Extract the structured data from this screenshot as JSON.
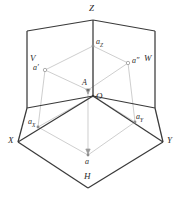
{
  "figure": {
    "type": "descriptive-geometry-three-projection-planes",
    "background_color": "#ffffff",
    "heavy_line_color": "#3a3a3a",
    "thin_line_color": "#b0b0b0",
    "text_color": "#2b2b2b"
  },
  "axes": {
    "z_label": "Z",
    "x_label": "X",
    "y_label": "Y",
    "origin_label": "O"
  },
  "planes": {
    "v_label": "V",
    "w_label": "W",
    "h_label": "H"
  },
  "points": {
    "space_point": "A",
    "front_projection": "a′",
    "profile_projection": "a″",
    "top_projection": "a",
    "x_intercept_base": "a",
    "x_intercept_sub": "X",
    "y_intercept_base": "a",
    "y_intercept_sub": "Y",
    "z_intercept_base": "a",
    "z_intercept_sub": "Z"
  },
  "geometry": {
    "origin": [
      93,
      96
    ],
    "z_apex": [
      93,
      20
    ],
    "x_corner": [
      18,
      142
    ],
    "y_corner": [
      163,
      142
    ],
    "v_top_left": [
      27,
      31
    ],
    "v_bottom_left": [
      27,
      108
    ],
    "w_top_right": [
      155,
      31
    ],
    "w_bottom_right": [
      155,
      108
    ],
    "h_front": [
      88,
      188
    ],
    "point_A": [
      88,
      90
    ],
    "a_front": [
      45,
      70
    ],
    "a_profile": [
      128,
      63
    ],
    "a_top": [
      88,
      155
    ],
    "a_x": [
      38,
      127
    ],
    "a_y": [
      135,
      122
    ],
    "a_z": [
      93,
      46
    ]
  }
}
